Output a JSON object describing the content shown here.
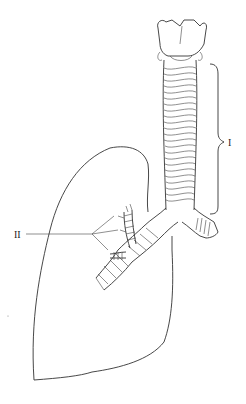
{
  "diagram": {
    "type": "anatomical-line-drawing",
    "labels": [
      {
        "id": "I",
        "text": "I",
        "points_to": "trachea (bracketed)"
      },
      {
        "id": "II",
        "text": "II",
        "points_to": "bronchial branches"
      }
    ],
    "colors": {
      "line": "#333333",
      "background": "#ffffff"
    }
  }
}
